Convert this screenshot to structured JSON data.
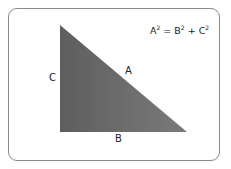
{
  "diagram": {
    "formula": {
      "lhs": "A",
      "lhs_exp": "2",
      "eq": " = ",
      "t1": "B",
      "t1_exp": "2",
      "plus": " + ",
      "t2": "C",
      "t2_exp": "2"
    },
    "labels": {
      "hypotenuse": "A",
      "base": "B",
      "height": "C"
    },
    "colors": {
      "fill_dark": "#5e5e5e",
      "fill_light": "#7a7a7a",
      "border": "#8a8a8a"
    }
  }
}
